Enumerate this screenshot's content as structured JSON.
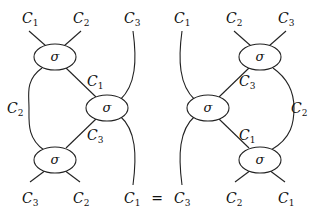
{
  "equation": {
    "equals_sign": "=",
    "node_symbol": "σ",
    "left": {
      "top_labels": [
        {
          "base": "C",
          "sub": "1"
        },
        {
          "base": "C",
          "sub": "2"
        },
        {
          "base": "C",
          "sub": "3"
        }
      ],
      "bottom_labels": [
        {
          "base": "C",
          "sub": "3"
        },
        {
          "base": "C",
          "sub": "2"
        },
        {
          "base": "C",
          "sub": "1"
        }
      ],
      "internal_labels": {
        "upper_diag": {
          "base": "C",
          "sub": "1"
        },
        "lower_diag": {
          "base": "C",
          "sub": "3"
        },
        "side": {
          "base": "C",
          "sub": "2"
        }
      }
    },
    "right": {
      "top_labels": [
        {
          "base": "C",
          "sub": "1"
        },
        {
          "base": "C",
          "sub": "2"
        },
        {
          "base": "C",
          "sub": "3"
        }
      ],
      "bottom_labels": [
        {
          "base": "C",
          "sub": "3"
        },
        {
          "base": "C",
          "sub": "2"
        },
        {
          "base": "C",
          "sub": "1"
        }
      ],
      "internal_labels": {
        "upper_diag": {
          "base": "C",
          "sub": "3"
        },
        "lower_diag": {
          "base": "C",
          "sub": "1"
        },
        "side": {
          "base": "C",
          "sub": "2"
        }
      }
    }
  }
}
